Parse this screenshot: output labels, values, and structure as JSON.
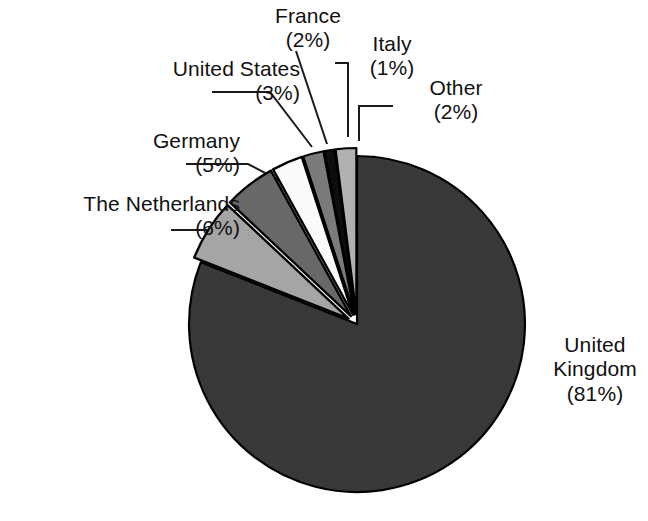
{
  "chart_data": {
    "type": "pie",
    "title": "",
    "subtitle": "",
    "xlabel": "",
    "ylabel": "",
    "legend_position": "none",
    "grid": false,
    "units": "percent",
    "start_angle_deg": 0,
    "direction": "clockwise",
    "categories": [
      "United Kingdom",
      "The Netherlands",
      "Germany",
      "United States",
      "France",
      "Italy",
      "Other"
    ],
    "values": [
      81,
      6,
      5,
      3,
      2,
      1,
      2
    ],
    "labels": [
      "United Kingdom (81%)",
      "The Netherlands (6%)",
      "Germany (5%)",
      "United States (3%)",
      "France (2%)",
      "Italy (1%)",
      "Other (2%)"
    ],
    "colors": [
      "#3a3a3a",
      "#a8a8a8",
      "#6a6a6a",
      "#ffffff",
      "#7d7d7d",
      "#0d0d0d",
      "#b4b4b4"
    ],
    "slices": [
      {
        "id": "united-kingdom",
        "name": "United Kingdom",
        "value": 81,
        "percent_text": "(81%)",
        "color": "#3a3a3a",
        "exploded": false,
        "start_deg": 0,
        "end_deg": 291.6
      },
      {
        "id": "the-netherlands",
        "name": "The Netherlands",
        "value": 6,
        "percent_text": "(6%)",
        "color": "#a8a8a8",
        "exploded": true,
        "start_deg": 291.6,
        "end_deg": 313.2
      },
      {
        "id": "germany",
        "name": "Germany",
        "value": 5,
        "percent_text": "(5%)",
        "color": "#6a6a6a",
        "exploded": true,
        "start_deg": 313.2,
        "end_deg": 331.2
      },
      {
        "id": "united-states",
        "name": "United States",
        "value": 3,
        "percent_text": "(3%)",
        "color": "#ffffff",
        "exploded": true,
        "start_deg": 331.2,
        "end_deg": 342.0
      },
      {
        "id": "france",
        "name": "France",
        "value": 2,
        "percent_text": "(2%)",
        "color": "#7d7d7d",
        "exploded": true,
        "start_deg": 342.0,
        "end_deg": 349.2
      },
      {
        "id": "italy",
        "name": "Italy",
        "value": 1,
        "percent_text": "(1%)",
        "color": "#0d0d0d",
        "exploded": true,
        "start_deg": 349.2,
        "end_deg": 352.8
      },
      {
        "id": "other",
        "name": "Other",
        "value": 2,
        "percent_text": "(2%)",
        "color": "#b4b4b4",
        "exploded": true,
        "start_deg": 352.8,
        "end_deg": 360.0
      }
    ]
  },
  "labels": {
    "netherlands": {
      "name": "The Netherlands",
      "percent": "(6%)"
    },
    "germany": {
      "name": "Germany",
      "percent": "(5%)"
    },
    "united_states": {
      "name": "United States",
      "percent": "(3%)"
    },
    "france": {
      "name": "France",
      "percent": "(2%)"
    },
    "italy": {
      "name": "Italy",
      "percent": "(1%)"
    },
    "other": {
      "name": "Other",
      "percent": "(2%)"
    },
    "united_kingdom": {
      "name": "United",
      "name2": "Kingdom",
      "percent": "(81%)"
    }
  },
  "style": {
    "background": "#ffffff",
    "text_color": "#111111",
    "outline_color": "#000000",
    "leader_color": "#1a1a1a"
  }
}
